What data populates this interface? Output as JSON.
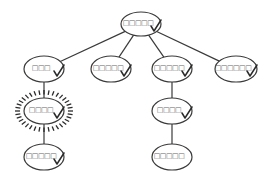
{
  "diagram": {
    "type": "tree",
    "colors": {
      "stroke": "#3a3a3a",
      "label": "#666666",
      "background": "#ffffff"
    },
    "nodes": [
      {
        "id": "root",
        "label": "□□□□□",
        "checked": true,
        "highlighted": false,
        "cx": 141,
        "cy": 24,
        "rx": 20,
        "ry": 12
      },
      {
        "id": "n1",
        "label": "□□□",
        "checked": true,
        "highlighted": false,
        "cx": 44,
        "cy": 69,
        "rx": 20,
        "ry": 13
      },
      {
        "id": "n2",
        "label": "□□□□□",
        "checked": true,
        "highlighted": false,
        "cx": 111,
        "cy": 69,
        "rx": 20,
        "ry": 13
      },
      {
        "id": "n3",
        "label": "□□□□□",
        "checked": true,
        "highlighted": false,
        "cx": 172,
        "cy": 69,
        "rx": 20,
        "ry": 13
      },
      {
        "id": "n4",
        "label": "□□□□□□",
        "checked": true,
        "highlighted": false,
        "cx": 236,
        "cy": 69,
        "rx": 21,
        "ry": 13
      },
      {
        "id": "n1a",
        "label": "□□□□",
        "checked": true,
        "highlighted": true,
        "cx": 44,
        "cy": 111,
        "rx": 20,
        "ry": 13
      },
      {
        "id": "n1a1",
        "label": "□□□□□",
        "checked": true,
        "highlighted": false,
        "cx": 44,
        "cy": 157,
        "rx": 20,
        "ry": 13
      },
      {
        "id": "n3a",
        "label": "□□□□",
        "checked": true,
        "highlighted": false,
        "cx": 172,
        "cy": 111,
        "rx": 20,
        "ry": 13
      },
      {
        "id": "n3a1",
        "label": "□□□□□",
        "checked": false,
        "highlighted": false,
        "cx": 172,
        "cy": 157,
        "rx": 20,
        "ry": 13
      }
    ],
    "edges": [
      {
        "from": "root",
        "to": "n1"
      },
      {
        "from": "root",
        "to": "n2"
      },
      {
        "from": "root",
        "to": "n3"
      },
      {
        "from": "root",
        "to": "n4"
      },
      {
        "from": "n1",
        "to": "n1a"
      },
      {
        "from": "n1a",
        "to": "n1a1"
      },
      {
        "from": "n3",
        "to": "n3a"
      },
      {
        "from": "n3a",
        "to": "n3a1"
      }
    ]
  }
}
